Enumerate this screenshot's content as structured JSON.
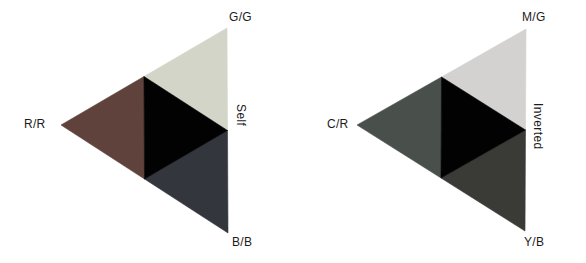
{
  "page": {
    "background": "#ffffff",
    "text_color": "#1c1c1c"
  },
  "figures": [
    {
      "id": "self-triangle",
      "side_label": "Self",
      "corner_labels": {
        "left": "R/R",
        "top": "G/G",
        "bottom": "B/B"
      },
      "colors": {
        "left_region": "#5e423b",
        "top_region": "#d3d5c9",
        "bottom_region": "#34363e",
        "center_region": "#020202"
      }
    },
    {
      "id": "inverted-triangle",
      "side_label": "Inverted",
      "corner_labels": {
        "left": "C/R",
        "top": "M/G",
        "bottom": "Y/B"
      },
      "colors": {
        "left_region": "#49504b",
        "top_region": "#d3d2d1",
        "bottom_region": "#3a3a37",
        "center_region": "#020202"
      }
    }
  ]
}
